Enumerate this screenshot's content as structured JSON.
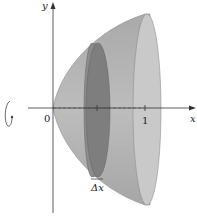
{
  "figure": {
    "type": "solid-of-revolution",
    "axis_labels": {
      "x": "x",
      "y": "y"
    },
    "origin_label": "0",
    "tick_labels": [
      "1"
    ],
    "slice_label": "Δx",
    "rotation_indicator": "rotation-about-x-axis",
    "colors": {
      "solid_fill": "#b4b4b4",
      "solid_shade": "#9a9a9a",
      "rim_fill": "#c8c8c8",
      "disk_fill": "#8a8a8a",
      "disk_face": "#7a7a7a",
      "axis": "#333333"
    }
  }
}
